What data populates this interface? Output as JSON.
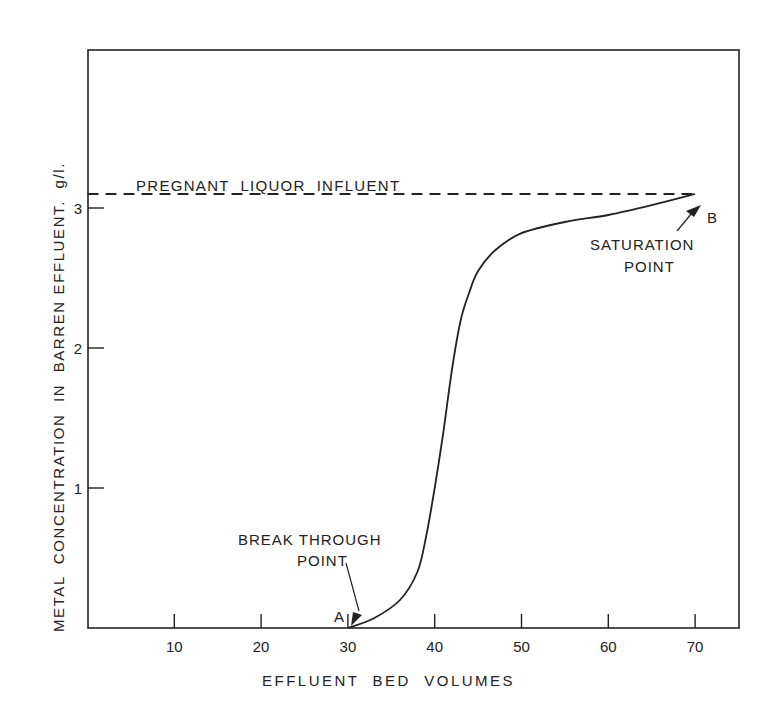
{
  "chart_data": {
    "type": "line",
    "title": "",
    "xlabel": "EFFLUENT BED VOLUMES",
    "ylabel": "METAL CONCENTRATION IN BARREN EFFLUENT. g/l.",
    "xlim": [
      0,
      75
    ],
    "ylim": [
      0,
      4
    ],
    "grid": false,
    "legend": null,
    "x_ticks": [
      10,
      20,
      30,
      40,
      50,
      60,
      70
    ],
    "y_ticks": [
      1,
      2,
      3
    ],
    "series": [
      {
        "name": "Breakthrough curve",
        "style": "solid",
        "x": [
          30,
          33,
          36,
          38,
          39,
          40,
          41,
          42,
          43,
          44,
          45,
          47,
          50,
          55,
          60,
          65,
          70
        ],
        "values": [
          0,
          0.07,
          0.2,
          0.4,
          0.65,
          1.0,
          1.4,
          1.85,
          2.2,
          2.4,
          2.55,
          2.7,
          2.82,
          2.9,
          2.95,
          3.02,
          3.1
        ]
      },
      {
        "name": "PREGNANT LIQUOR INFLUENT",
        "style": "dashed",
        "x": [
          0,
          70
        ],
        "values": [
          3.1,
          3.1
        ]
      }
    ],
    "annotations": [
      {
        "text": "PREGNANT LIQUOR INFLUENT",
        "x": 10,
        "y": 3.3
      },
      {
        "text": "A",
        "x": 29.5,
        "y": 0.07,
        "marks": "BREAK THROUGH POINT"
      },
      {
        "text": "B",
        "x": 71.5,
        "y": 3.0,
        "marks": "SATURATION POINT"
      },
      {
        "text": "BREAK THROUGH",
        "x": 31,
        "y": 0.65
      },
      {
        "text": "POINT",
        "x": 31,
        "y": 0.45
      },
      {
        "text": "SATURATION",
        "x": 64,
        "y": 2.8
      },
      {
        "text": "POINT",
        "x": 64,
        "y": 2.6
      }
    ]
  },
  "labels": {
    "influent": "PREGNANT  LIQUOR  INFLUENT",
    "point_a": "A",
    "point_b": "B",
    "breakthrough_line1": "BREAK THROUGH",
    "breakthrough_line2": "POINT",
    "saturation_line1": "SATURATION",
    "saturation_line2": "POINT",
    "xlabel": "EFFLUENT  BED  VOLUMES",
    "ylabel": "METAL  CONCENTRATION  IN  BARREN EFFLUENT.  g/l."
  },
  "colors": {
    "ink": "#222222",
    "background": "#ffffff"
  }
}
